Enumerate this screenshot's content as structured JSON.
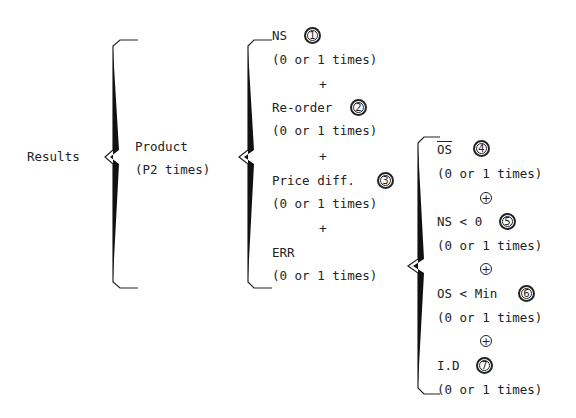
{
  "root": {
    "label": "Results"
  },
  "level1": {
    "label": "Product",
    "repeat": "(P2 times)"
  },
  "level2": {
    "items": [
      {
        "label": "NS",
        "number": "1",
        "repeat": "(0 or 1 times)"
      },
      {
        "label": "Re-order",
        "number": "2",
        "repeat": "(0 or 1 times)"
      },
      {
        "label": "Price diff.",
        "number": "3",
        "repeat": "(0 or 1 times)"
      },
      {
        "label": "ERR",
        "repeat": "(0 or 1 times)"
      }
    ],
    "separator": "+"
  },
  "level3": {
    "items": [
      {
        "label": "OS",
        "overline": true,
        "number": "4",
        "repeat": "(0 or 1 times)"
      },
      {
        "label": "NS < 0",
        "number": "5",
        "repeat": "(0 or 1 times)"
      },
      {
        "label": "OS < Min",
        "number": "6",
        "repeat": "(0 or 1 times)"
      },
      {
        "label": "I.D",
        "number": "7",
        "repeat": "(0 or 1 times)"
      }
    ],
    "separator": "+"
  }
}
